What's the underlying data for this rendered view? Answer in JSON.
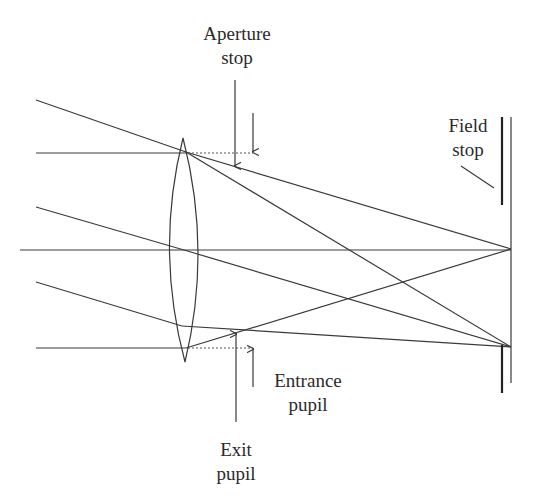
{
  "diagram": {
    "colors": {
      "line": "#333333",
      "background": "#ffffff"
    },
    "labels": {
      "aperture_stop": [
        "Aperture",
        "stop"
      ],
      "field_stop": [
        "Field",
        "stop"
      ],
      "entrance_pupil": [
        "Entrance",
        "pupil"
      ],
      "exit_pupil": [
        "Exit",
        "pupil"
      ]
    },
    "elements": {
      "lens": {
        "type": "biconvex",
        "top": [
          183,
          138
        ],
        "bottom": [
          185,
          362
        ],
        "center_x": 184
      },
      "optical_axis": {
        "y": 250,
        "x_start": 20,
        "x_end": 511
      },
      "image_plane": {
        "x": 511,
        "y_top": 117,
        "y_bottom": 383
      },
      "field_stop_bars": [
        {
          "x": 502,
          "y1": 117,
          "y2": 205
        },
        {
          "x": 502,
          "y1": 345,
          "y2": 393
        }
      ],
      "focus_points": [
        [
          511,
          249
        ],
        [
          511,
          347
        ]
      ]
    }
  }
}
